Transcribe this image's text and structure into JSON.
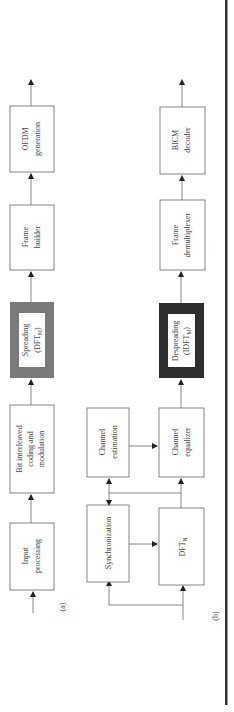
{
  "diagram": {
    "orientation": "rotated 90 degrees counter-clockwise (signal flows bottom to top)",
    "part_a": {
      "label": "(a)",
      "blocks": [
        {
          "id": "input-processing",
          "lines": [
            "Input",
            "processing"
          ],
          "style": "plain"
        },
        {
          "id": "bicm-coding",
          "lines": [
            "Bit interleaved",
            "coding and",
            "modulation"
          ],
          "style": "plain"
        },
        {
          "id": "spreading",
          "lines": [
            "Spreading",
            "(DFT",
            "M",
            ")"
          ],
          "style": "gray-frame"
        },
        {
          "id": "frame-builder",
          "lines": [
            "Frame",
            "builder"
          ],
          "style": "plain"
        },
        {
          "id": "ofdm-generation",
          "lines": [
            "OFDM",
            "generation"
          ],
          "style": "plain"
        }
      ]
    },
    "part_b": {
      "label": "(b)",
      "blocks": [
        {
          "id": "synchronization",
          "lines": [
            "Synchronization"
          ],
          "style": "plain"
        },
        {
          "id": "dft-n",
          "lines": [
            "DFT",
            "N"
          ],
          "style": "plain"
        },
        {
          "id": "channel-estimation",
          "lines": [
            "Channel",
            "estimation"
          ],
          "style": "plain"
        },
        {
          "id": "channel-equalizer",
          "lines": [
            "Channel",
            "equalizer"
          ],
          "style": "plain"
        },
        {
          "id": "despreading",
          "lines": [
            "Despreading",
            "(IDFT",
            "M",
            ")"
          ],
          "style": "dark-frame"
        },
        {
          "id": "frame-demultiplexer",
          "lines": [
            "Frame",
            "demultiplexer"
          ],
          "style": "plain"
        },
        {
          "id": "bicm-decoder",
          "lines": [
            "BICM",
            "decoder"
          ],
          "style": "plain"
        }
      ]
    },
    "colors": {
      "spreading_frame": "#7a7a7a",
      "despreading_frame": "#2e2e2e",
      "separator_rule": "#333333"
    }
  }
}
